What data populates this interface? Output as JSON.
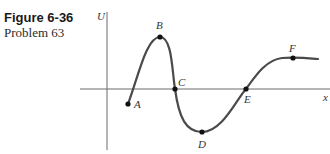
{
  "caption": {
    "figure": "Figure 6-36",
    "problem": "Problem 63"
  },
  "axes": {
    "y_label": "U",
    "x_label": "x"
  },
  "points": {
    "A": "A",
    "B": "B",
    "C": "C",
    "D": "D",
    "E": "E",
    "F": "F"
  },
  "colors": {
    "curve": "#4a4a4a",
    "axis": "#666666",
    "point": "#111111"
  }
}
